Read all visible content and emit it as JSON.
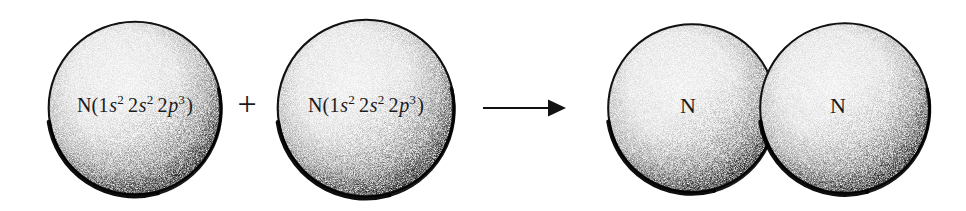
{
  "figure": {
    "title": "Formation of a nitrogen molecule from two nitrogen atoms",
    "background_color": "#ffffff",
    "ink_color": "#000000",
    "style": "stippled line art"
  },
  "reactants": [
    {
      "id": "atom-1",
      "label_plain": "N(1s2 2s2 2p3)",
      "element": "N",
      "open_paren": "(",
      "close_paren": ")",
      "orbitals": [
        {
          "shell": "1",
          "subshell": "s",
          "electrons": "2"
        },
        {
          "shell": "2",
          "subshell": "s",
          "electrons": "2"
        },
        {
          "shell": "2",
          "subshell": "p",
          "electrons": "3"
        }
      ]
    },
    {
      "id": "atom-2",
      "label_plain": "N(1s2 2s2 2p3)",
      "element": "N",
      "open_paren": "(",
      "close_paren": ")",
      "orbitals": [
        {
          "shell": "1",
          "subshell": "s",
          "electrons": "2"
        },
        {
          "shell": "2",
          "subshell": "s",
          "electrons": "2"
        },
        {
          "shell": "2",
          "subshell": "p",
          "electrons": "3"
        }
      ]
    }
  ],
  "operators": {
    "plus": "+",
    "arrow": "→",
    "arrow_name": "reaction-arrow"
  },
  "product": {
    "id": "molecule-n2",
    "name": "N2",
    "atoms": [
      {
        "id": "product-atom-left",
        "label": "N"
      },
      {
        "id": "product-atom-right",
        "label": "N"
      }
    ]
  },
  "geometry": {
    "canvas": {
      "width": 966,
      "height": 211
    },
    "spheres": [
      {
        "cx": 135,
        "cy": 108,
        "r": 87
      },
      {
        "cx": 366,
        "cy": 108,
        "r": 89
      },
      {
        "cx": 692,
        "cy": 108,
        "r": 84
      },
      {
        "cx": 845,
        "cy": 108,
        "r": 85
      }
    ],
    "plus": {
      "x": 247,
      "y": 105
    },
    "arrow": {
      "x1": 483,
      "x2": 563,
      "y": 108
    },
    "label_positions": [
      {
        "x": 135,
        "y": 105
      },
      {
        "x": 366,
        "y": 105
      },
      {
        "x": 688,
        "y": 106
      },
      {
        "x": 838,
        "y": 106
      }
    ]
  }
}
